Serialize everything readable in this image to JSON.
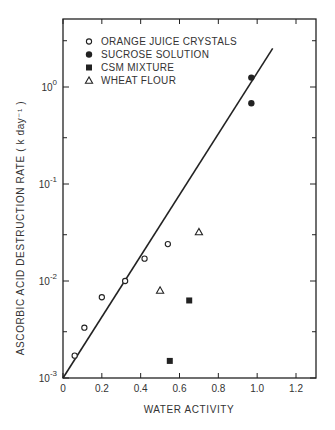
{
  "chart_data": {
    "type": "scatter",
    "title": "",
    "xlabel": "WATER ACTIVITY",
    "ylabel": "ASCORBIC ACID DESTRUCTION RATE ( k day⁻¹ )",
    "xlim": [
      0,
      1.3
    ],
    "ylim": [
      0.001,
      4.5
    ],
    "yscale": "log",
    "grid": false,
    "legend_position": "upper-left",
    "x_ticks": [
      0,
      0.2,
      0.4,
      0.6,
      0.8,
      1.0,
      1.2
    ],
    "x_tick_labels": [
      "0",
      "0.2",
      "0.4",
      "0.6",
      "0.8",
      "1.0",
      "1.2"
    ],
    "y_ticks": [
      0.001,
      0.01,
      0.1,
      1
    ],
    "y_tick_labels": [
      {
        "base": "10",
        "exp": "-3"
      },
      {
        "base": "10",
        "exp": "-2"
      },
      {
        "base": "10",
        "exp": "-1"
      },
      {
        "base": "10",
        "exp": "0"
      }
    ],
    "series": [
      {
        "name": "ORANGE JUICE CRYSTALS",
        "marker": "open-circle",
        "points": [
          {
            "x": 0.06,
            "y": 0.0017
          },
          {
            "x": 0.11,
            "y": 0.0033
          },
          {
            "x": 0.2,
            "y": 0.0068
          },
          {
            "x": 0.32,
            "y": 0.01
          },
          {
            "x": 0.42,
            "y": 0.017
          },
          {
            "x": 0.54,
            "y": 0.024
          }
        ]
      },
      {
        "name": "SUCROSE SOLUTION",
        "marker": "filled-circle",
        "points": [
          {
            "x": 0.97,
            "y": 1.25
          },
          {
            "x": 0.97,
            "y": 0.68
          }
        ]
      },
      {
        "name": "CSM MIXTURE",
        "marker": "filled-square",
        "points": [
          {
            "x": 0.65,
            "y": 0.0063
          },
          {
            "x": 0.55,
            "y": 0.0015
          }
        ]
      },
      {
        "name": "WHEAT FLOUR",
        "marker": "open-triangle",
        "points": [
          {
            "x": 0.5,
            "y": 0.008
          },
          {
            "x": 0.7,
            "y": 0.032
          }
        ]
      }
    ],
    "fit_line": {
      "type": "line",
      "points": [
        {
          "x": 0.0,
          "y": 0.001
        },
        {
          "x": 1.08,
          "y": 2.5
        }
      ]
    }
  },
  "colors": {
    "ink": "#222222",
    "background": "#ffffff"
  }
}
